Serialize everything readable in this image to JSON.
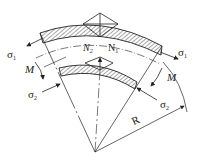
{
  "diagram": {
    "type": "curved beam in pure bending",
    "labels": {
      "sigma1_left": {
        "sym": "σ",
        "sub": "1"
      },
      "sigma1_right": {
        "sym": "σ",
        "sub": "1"
      },
      "sigma2_left": {
        "sym": "σ",
        "sub": "2"
      },
      "sigma2_right": {
        "sym": "σ",
        "sub": "2"
      },
      "moment_left": "M",
      "moment_right": "M",
      "n2": {
        "sym": "N",
        "sub": "2"
      },
      "n1": {
        "sym": "N",
        "sub": "1"
      },
      "radius": "R"
    },
    "colors": {
      "line": "#222222",
      "background": "#ffffff"
    }
  }
}
